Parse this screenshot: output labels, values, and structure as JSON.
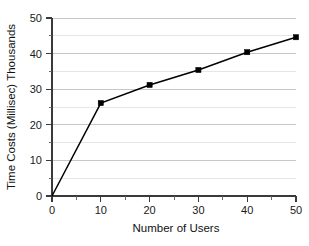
{
  "chart_data": {
    "type": "line",
    "title": "",
    "subtitle": "",
    "xlabel": "Number of Users",
    "ylabel": "Time Costs (Millisec) Thousands",
    "xlim": [
      0,
      50
    ],
    "ylim": [
      0,
      50
    ],
    "xticks": [
      0,
      10,
      20,
      30,
      40,
      50
    ],
    "yticks": [
      0,
      10,
      20,
      30,
      40,
      50
    ],
    "xtick_labels": [
      "0",
      "10",
      "20",
      "30",
      "40",
      "50"
    ],
    "ytick_labels": [
      "0",
      "10",
      "20",
      "30",
      "40",
      "50"
    ],
    "x_minor_ticks": [
      5,
      15,
      25,
      35,
      45
    ],
    "y_minor_ticks": [
      5,
      15,
      25,
      35,
      45
    ],
    "grid": "horizontal",
    "grid_major_color": "#b9b9b9",
    "grid_minor_color": "#dcdcdc",
    "legend": "none",
    "marker": "square",
    "line_color": "#000000",
    "series": [
      {
        "name": "Time Costs",
        "x": [
          0,
          10,
          20,
          30,
          40,
          50
        ],
        "values": [
          0,
          26.1,
          31.2,
          35.4,
          40.4,
          44.6
        ]
      }
    ]
  },
  "axes": {
    "y_title": "Time Costs (Millisec) Thousands",
    "x_title": "Number of Users"
  }
}
